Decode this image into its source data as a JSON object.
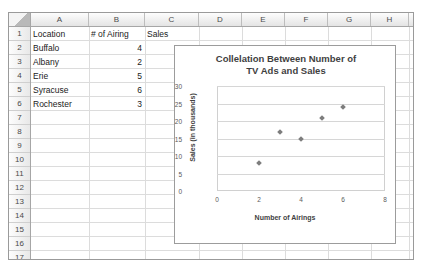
{
  "sheet": {
    "columns": [
      "A",
      "B",
      "C",
      "D",
      "E",
      "F",
      "G",
      "H",
      "I"
    ],
    "rows": [
      "1",
      "2",
      "3",
      "4",
      "5",
      "6",
      "7",
      "8",
      "9",
      "10",
      "11",
      "12",
      "13",
      "14",
      "15",
      "16",
      "17"
    ],
    "cells": {
      "a1": "Location",
      "b1": "# of Airing",
      "c1": "Sales",
      "a2": "Buffalo",
      "b2": "4",
      "c2": "15",
      "a3": "Albany",
      "b3": "2",
      "c3": "8",
      "a4": "Erie",
      "b4": "5",
      "c4": "21",
      "a5": "Syracuse",
      "b5": "6",
      "c5": "24",
      "a6": "Rochester",
      "b6": "3",
      "c6": "17"
    }
  },
  "chart_data": {
    "type": "scatter",
    "title": "Collelation Between Number of TV Ads and Sales",
    "title_line1": "Collelation Between Number of",
    "title_line2": "TV Ads and Sales",
    "xlabel": "Number of Airings",
    "ylabel": "Sales (in thousands)",
    "xlim": [
      0,
      8
    ],
    "ylim": [
      0,
      30
    ],
    "xticks": [
      "0",
      "2",
      "4",
      "6",
      "8"
    ],
    "yticks": [
      "0",
      "5",
      "10",
      "15",
      "20",
      "25",
      "30"
    ],
    "grid": "horizontal",
    "legend": "none",
    "points": [
      {
        "label": "Albany",
        "x": 2,
        "y": 8
      },
      {
        "label": "Rochester",
        "x": 3,
        "y": 17
      },
      {
        "label": "Buffalo",
        "x": 4,
        "y": 15
      },
      {
        "label": "Erie",
        "x": 5,
        "y": 21
      },
      {
        "label": "Syracuse",
        "x": 6,
        "y": 24
      }
    ],
    "marker_color": "#7d7d7d"
  }
}
